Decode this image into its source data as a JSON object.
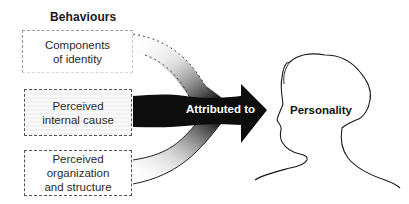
{
  "diagram": {
    "heading": "Behaviours",
    "boxes": [
      {
        "id": "components",
        "lines": [
          "Components",
          "of identity"
        ]
      },
      {
        "id": "internal-cause",
        "lines": [
          "Perceived",
          "internal cause"
        ]
      },
      {
        "id": "organization",
        "lines": [
          "Perceived",
          "organization",
          "and structure"
        ]
      }
    ],
    "arrow_label": "Attributed to",
    "target_label": "Personality",
    "colors": {
      "arrow": "#0d0d0d",
      "outline": "#1a1a1a",
      "box_border": "#555555",
      "background": "#ffffff"
    }
  }
}
